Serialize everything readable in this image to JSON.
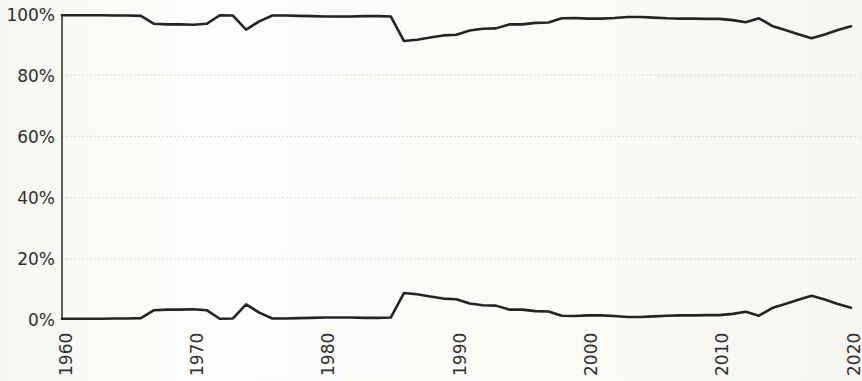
{
  "chart_data": {
    "type": "line",
    "title": "",
    "subtitle": "",
    "xlabel": "",
    "ylabel": "",
    "xlim": [
      1960,
      2020
    ],
    "ylim": [
      0,
      100
    ],
    "grid": true,
    "legend_position": "none",
    "y_tick_labels": [
      "100%",
      "80%",
      "60%",
      "40%",
      "20%",
      "0%"
    ],
    "y_tick_values": [
      100,
      80,
      60,
      40,
      20,
      0
    ],
    "x_tick_labels": [
      "1960",
      "1970",
      "1980",
      "1990",
      "2000",
      "2010",
      "2020"
    ],
    "x_tick_values": [
      1960,
      1970,
      1980,
      1990,
      2000,
      2010,
      2020
    ],
    "x": [
      1960,
      1961,
      1962,
      1963,
      1964,
      1965,
      1966,
      1967,
      1968,
      1969,
      1970,
      1971,
      1972,
      1973,
      1974,
      1975,
      1976,
      1977,
      1978,
      1979,
      1980,
      1981,
      1982,
      1983,
      1984,
      1985,
      1986,
      1987,
      1988,
      1989,
      1990,
      1991,
      1992,
      1993,
      1994,
      1995,
      1996,
      1997,
      1998,
      1999,
      2000,
      2001,
      2002,
      2003,
      2004,
      2005,
      2006,
      2007,
      2008,
      2009,
      2010,
      2011,
      2012,
      2013,
      2014,
      2015,
      2016,
      2017,
      2018,
      2019,
      2020
    ],
    "series": [
      {
        "name": "upper-series",
        "color": "#242424",
        "values": [
          99.6,
          99.6,
          99.6,
          99.6,
          99.5,
          99.5,
          99.4,
          96.8,
          96.6,
          96.6,
          96.5,
          96.8,
          99.6,
          99.5,
          94.9,
          97.6,
          99.5,
          99.5,
          99.4,
          99.3,
          99.2,
          99.2,
          99.2,
          99.3,
          99.3,
          99.2,
          91.2,
          91.6,
          92.3,
          93.0,
          93.2,
          94.6,
          95.2,
          95.3,
          96.6,
          96.6,
          97.1,
          97.2,
          98.6,
          98.7,
          98.5,
          98.5,
          98.7,
          99.0,
          99.0,
          98.8,
          98.6,
          98.5,
          98.5,
          98.4,
          98.4,
          98.0,
          97.3,
          98.6,
          96.1,
          94.8,
          93.4,
          92.1,
          93.3,
          94.8,
          96.0
        ]
      },
      {
        "name": "lower-series",
        "color": "#242424",
        "values": [
          0.4,
          0.4,
          0.4,
          0.4,
          0.5,
          0.5,
          0.6,
          3.2,
          3.4,
          3.4,
          3.5,
          3.2,
          0.4,
          0.5,
          5.1,
          2.4,
          0.5,
          0.5,
          0.6,
          0.7,
          0.8,
          0.8,
          0.8,
          0.7,
          0.7,
          0.8,
          8.8,
          8.4,
          7.7,
          7.0,
          6.8,
          5.4,
          4.8,
          4.7,
          3.4,
          3.4,
          2.9,
          2.8,
          1.4,
          1.3,
          1.5,
          1.5,
          1.3,
          1.0,
          1.0,
          1.2,
          1.4,
          1.5,
          1.5,
          1.6,
          1.6,
          2.0,
          2.7,
          1.4,
          3.9,
          5.2,
          6.6,
          7.9,
          6.7,
          5.2,
          4.0
        ]
      }
    ]
  },
  "axes": {
    "y_axis_name": "percent-axis",
    "x_axis_name": "year-axis"
  },
  "style": {
    "line_color": "#242424",
    "grid_color": "#d8d8d6",
    "axis_color": "#1a1a1a",
    "background": "#fbfbf9",
    "tick_text_color": "#2f2f2f"
  }
}
